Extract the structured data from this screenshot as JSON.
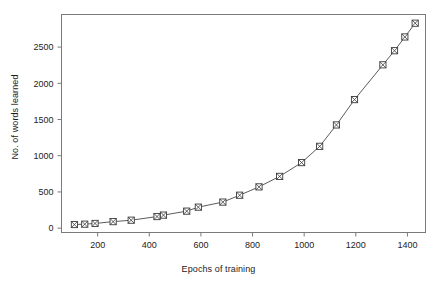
{
  "figure": {
    "title_remnant": "",
    "background_color": "#ffffff",
    "frame_color": "#7a7a7a",
    "line_color": "#4a4a4a",
    "marker_color": "#3a3a3a",
    "text_color": "#1c1c1c"
  },
  "chart_data": {
    "type": "line",
    "title": "",
    "subtitle": "",
    "xlabel": "Epochs of training",
    "ylabel": "No. of words learned",
    "xlim": [
      60,
      1470
    ],
    "ylim": [
      -60,
      2950
    ],
    "xticks": [
      200,
      400,
      600,
      800,
      1000,
      1200,
      1400
    ],
    "xticklabels": [
      "200",
      "400",
      "600",
      "800",
      "1000",
      "1200",
      "1400"
    ],
    "yticks": [
      0,
      500,
      1000,
      1500,
      2000,
      2500
    ],
    "yticklabels": [
      "0",
      "500",
      "1000",
      "1500",
      "2000",
      "2500"
    ],
    "grid": false,
    "legend": null,
    "marker": "crossed-square",
    "series": [
      {
        "name": "Words learned",
        "x": [
          110,
          150,
          190,
          260,
          330,
          430,
          455,
          545,
          590,
          685,
          750,
          825,
          905,
          990,
          1060,
          1125,
          1195,
          1305,
          1350,
          1390,
          1430
        ],
        "y": [
          50,
          55,
          65,
          90,
          110,
          160,
          180,
          235,
          290,
          360,
          455,
          570,
          715,
          905,
          1130,
          1425,
          1775,
          2255,
          2450,
          2640,
          2830
        ]
      }
    ]
  }
}
